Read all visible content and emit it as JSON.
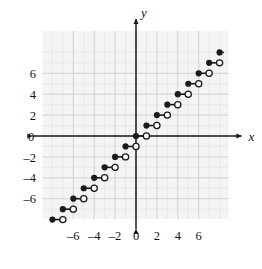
{
  "figure": {
    "title": "",
    "axis_labels": {
      "x": "x",
      "y": "y"
    },
    "colors": {
      "axis": "#1a1a1a",
      "grid_minor": "#e4e4e4",
      "grid_major": "#cfcfcf",
      "plot_background": "#f4f4f4",
      "point_fill": "#1a1a1a",
      "point_open_fill": "#ffffff",
      "segment": "#1a1a1a",
      "page_background": "#ffffff"
    }
  },
  "chart_data": {
    "type": "line",
    "title": "",
    "xlabel": "x",
    "ylabel": "y",
    "grid": true,
    "legend": "none",
    "xlim": [
      -9.0,
      8.8
    ],
    "ylim": [
      -9.0,
      8.9
    ],
    "xticks": [
      -6,
      -4,
      -2,
      0,
      2,
      4,
      6
    ],
    "yticks": [
      -6,
      -4,
      -2,
      0,
      2,
      4,
      6
    ],
    "xtick_labels": [
      "–6",
      "–4",
      "–2",
      "0",
      "2",
      "4",
      "6"
    ],
    "ytick_labels": [
      "–6",
      "–4",
      "–2",
      "0",
      "2",
      "4",
      "6"
    ],
    "x_minor_step": 1,
    "y_minor_step": 1,
    "series": [
      {
        "name": "floor-step-function",
        "style": "step-segments",
        "segments": [
          {
            "x_start": -8,
            "x_end": -7,
            "y": -8,
            "left_endpoint": "closed",
            "right_endpoint": "open"
          },
          {
            "x_start": -7,
            "x_end": -6,
            "y": -7,
            "left_endpoint": "closed",
            "right_endpoint": "open"
          },
          {
            "x_start": -6,
            "x_end": -5,
            "y": -6,
            "left_endpoint": "closed",
            "right_endpoint": "open"
          },
          {
            "x_start": -5,
            "x_end": -4,
            "y": -5,
            "left_endpoint": "closed",
            "right_endpoint": "open"
          },
          {
            "x_start": -4,
            "x_end": -3,
            "y": -4,
            "left_endpoint": "closed",
            "right_endpoint": "open"
          },
          {
            "x_start": -3,
            "x_end": -2,
            "y": -3,
            "left_endpoint": "closed",
            "right_endpoint": "open"
          },
          {
            "x_start": -2,
            "x_end": -1,
            "y": -2,
            "left_endpoint": "closed",
            "right_endpoint": "open"
          },
          {
            "x_start": -1,
            "x_end": 0,
            "y": -1,
            "left_endpoint": "closed",
            "right_endpoint": "open"
          },
          {
            "x_start": 0,
            "x_end": 1,
            "y": 0,
            "left_endpoint": "closed",
            "right_endpoint": "open"
          },
          {
            "x_start": 1,
            "x_end": 2,
            "y": 1,
            "left_endpoint": "closed",
            "right_endpoint": "open"
          },
          {
            "x_start": 2,
            "x_end": 3,
            "y": 2,
            "left_endpoint": "closed",
            "right_endpoint": "open"
          },
          {
            "x_start": 3,
            "x_end": 4,
            "y": 3,
            "left_endpoint": "closed",
            "right_endpoint": "open"
          },
          {
            "x_start": 4,
            "x_end": 5,
            "y": 4,
            "left_endpoint": "closed",
            "right_endpoint": "open"
          },
          {
            "x_start": 5,
            "x_end": 6,
            "y": 5,
            "left_endpoint": "closed",
            "right_endpoint": "open"
          },
          {
            "x_start": 6,
            "x_end": 7,
            "y": 6,
            "left_endpoint": "closed",
            "right_endpoint": "open"
          },
          {
            "x_start": 7,
            "x_end": 8,
            "y": 7,
            "left_endpoint": "closed",
            "right_endpoint": "open"
          },
          {
            "x_start": 8,
            "x_end": 8.4,
            "y": 8,
            "left_endpoint": "closed",
            "right_endpoint": "none"
          }
        ]
      }
    ]
  }
}
